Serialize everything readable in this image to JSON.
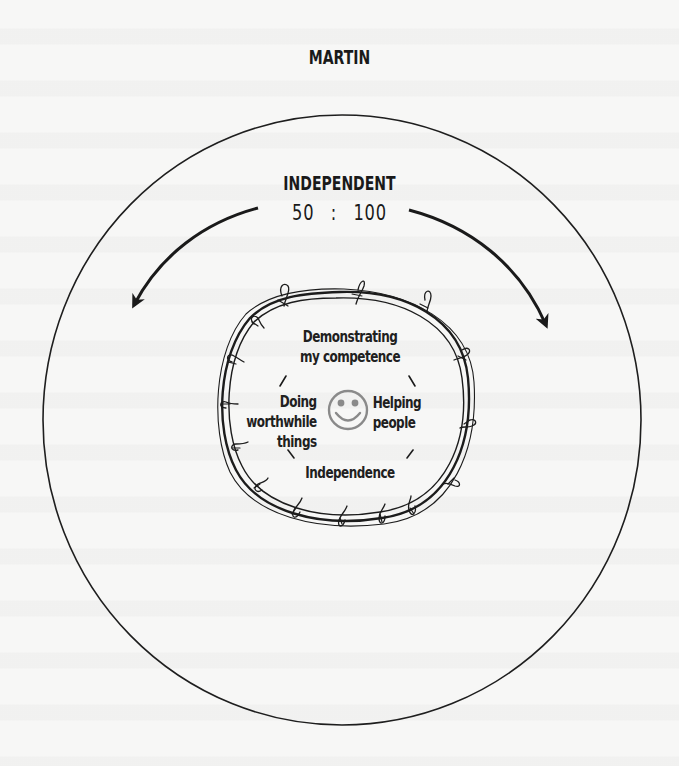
{
  "diagram": {
    "title": "MARTIN",
    "ratio": {
      "label": "INDEPENDENT",
      "left": "50",
      "separator": ":",
      "right": "100",
      "display": "50  :  100"
    },
    "center_icon": "smiley-face-icon",
    "boundary_style": "barbed-wire",
    "values": {
      "top": "Demonstrating\nmy competence",
      "top_line1": "Demonstrating",
      "top_line2": "my competence",
      "left_line1": "Doing",
      "left_line2": "worthwhile",
      "left_line3": "things",
      "right_line1": "Helping",
      "right_line2": "people",
      "bottom": "Independence"
    },
    "arrows": [
      {
        "direction": "counter-clockwise",
        "side": "left"
      },
      {
        "direction": "clockwise",
        "side": "right"
      }
    ],
    "colors": {
      "ink": "#1a1a1a",
      "smiley": "#8a8a8a",
      "paper": "#f7f7f6"
    }
  }
}
